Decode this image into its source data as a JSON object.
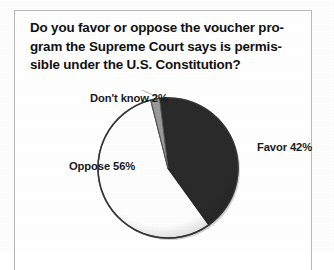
{
  "figure": {
    "title": "Do you favor or oppose the voucher pro-\ngram the Supreme Court says is permis-\nsible under the U.S. Constitution?"
  },
  "labels": {
    "dont_know": "Don't know 2%",
    "favor": "Favor 42%",
    "oppose": "Oppose 56%"
  },
  "chart_data": {
    "type": "pie",
    "categories": [
      "Favor",
      "Oppose",
      "Don't know"
    ],
    "values": [
      42,
      56,
      2
    ],
    "unit": "%",
    "labels": [
      "Favor 42%",
      "Oppose 56%",
      "Don't know 2%"
    ],
    "colors": [
      "#2b2b2b",
      "#fdfdfd",
      "#9a9a9a"
    ],
    "start_angle_deg": -7,
    "direction": "clockwise",
    "legend": "none",
    "data_labels": "outside",
    "grid": false
  }
}
